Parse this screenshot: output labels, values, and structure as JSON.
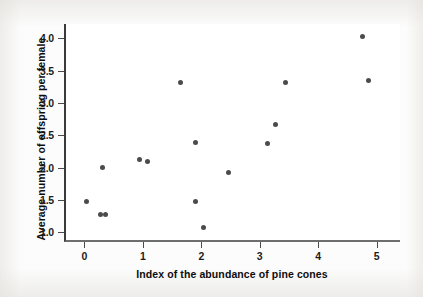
{
  "chart_data": {
    "type": "scatter",
    "title": "",
    "xlabel": "Index of the abundance of pine cones",
    "ylabel": "Average number of offspring per female",
    "xlim": [
      -0.35,
      5.4
    ],
    "ylim": [
      0.85,
      4.22
    ],
    "xticks": [
      0,
      1,
      2,
      3,
      4,
      5
    ],
    "xticklabels": [
      "0",
      "1",
      "2",
      "3",
      "4",
      "5"
    ],
    "yticks": [
      1.0,
      1.5,
      2.0,
      2.5,
      3.0,
      3.5,
      4.0
    ],
    "yticklabels": [
      "1.0",
      "1.5",
      "2.0",
      "2.5",
      "3.0",
      "3.5",
      "4.0"
    ],
    "grid": false,
    "legend": null,
    "marker_color": "#4b4b4b",
    "points": [
      {
        "x": 0.0,
        "y": 1.48
      },
      {
        "x": 0.28,
        "y": 2.0
      },
      {
        "x": 0.24,
        "y": 1.28
      },
      {
        "x": 0.33,
        "y": 1.28
      },
      {
        "x": 0.91,
        "y": 2.12
      },
      {
        "x": 1.05,
        "y": 2.09
      },
      {
        "x": 1.61,
        "y": 3.32
      },
      {
        "x": 1.86,
        "y": 2.39
      },
      {
        "x": 1.87,
        "y": 1.47
      },
      {
        "x": 2.01,
        "y": 1.08
      },
      {
        "x": 2.43,
        "y": 1.93
      },
      {
        "x": 3.09,
        "y": 2.37
      },
      {
        "x": 3.23,
        "y": 2.67
      },
      {
        "x": 3.41,
        "y": 3.32
      },
      {
        "x": 4.73,
        "y": 4.02
      },
      {
        "x": 4.83,
        "y": 3.35
      }
    ]
  },
  "figure": {
    "background_color": "#fcfcfc",
    "plot_background_color": "#ffffff",
    "axis_color": "#4a4a4a"
  }
}
